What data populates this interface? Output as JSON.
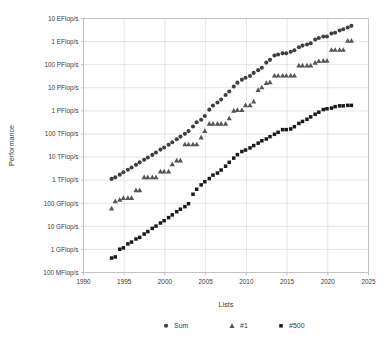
{
  "chart_data": {
    "type": "scatter",
    "title": "",
    "xlabel": "Lists",
    "ylabel": "Performance",
    "xlim": [
      1990,
      2025
    ],
    "ylim_flops": [
      100000000.0,
      1e+19
    ],
    "grid": true,
    "legend_position": "bottom",
    "x_ticks": [
      "1990",
      "1995",
      "2000",
      "2005",
      "2010",
      "2015",
      "2020",
      "2025"
    ],
    "x_tick_values": [
      1990,
      1995,
      2000,
      2005,
      2010,
      2015,
      2020,
      2025
    ],
    "y_ticks": [
      "100 MFlop/s",
      "1 GFlop/s",
      "10 GFlop/s",
      "100 GFlop/s",
      "1 TFlop/s",
      "10 TFlop/s",
      "100 TFlop/s",
      "1 PFlop/s",
      "10 PFlop/s",
      "100 PFlop/s",
      "1 EFlop/s",
      "10 EFlop/s"
    ],
    "y_tick_values": [
      100000000.0,
      1000000000.0,
      10000000000.0,
      100000000000.0,
      1000000000000.0,
      10000000000000.0,
      100000000000000.0,
      1000000000000000.0,
      1e+16,
      1e+17,
      1e+18,
      1e+19
    ],
    "series": [
      {
        "name": "Sum",
        "marker": "circle",
        "color": "#3f3f3f",
        "x": [
          1993.45,
          1993.9,
          1994.45,
          1994.9,
          1995.45,
          1995.9,
          1996.45,
          1996.9,
          1997.45,
          1997.9,
          1998.45,
          1998.9,
          1999.45,
          1999.9,
          2000.45,
          2000.9,
          2001.45,
          2001.9,
          2002.45,
          2002.9,
          2003.45,
          2003.9,
          2004.45,
          2004.9,
          2005.45,
          2005.9,
          2006.45,
          2006.9,
          2007.45,
          2007.9,
          2008.45,
          2008.9,
          2009.45,
          2009.9,
          2010.45,
          2010.9,
          2011.45,
          2011.9,
          2012.45,
          2012.9,
          2013.45,
          2013.9,
          2014.45,
          2014.9,
          2015.45,
          2015.9,
          2016.45,
          2016.9,
          2017.45,
          2017.9,
          2018.45,
          2018.9,
          2019.45,
          2019.9,
          2020.45,
          2020.9,
          2021.45,
          2021.9,
          2022.45,
          2022.9
        ],
        "y": [
          1130000000000.0,
          1320000000000.0,
          1730000000000.0,
          2200000000000.0,
          2800000000000.0,
          3500000000000.0,
          4600000000000.0,
          5900000000000.0,
          7600000000000.0,
          9600000000000.0,
          12400000000000.0,
          15800000000000.0,
          21000000000000.0,
          26000000000000.0,
          34000000000000.0,
          44000000000000.0,
          59000000000000.0,
          77000000000000.0,
          101000000000000.0,
          133000000000000.0,
          210000000000000.0,
          320000000000000.0,
          410000000000000.0,
          600000000000000.0,
          1130000000000000.0,
          1690000000000000.0,
          2300000000000000.0,
          3100000000000000.0,
          4900000000000000.0,
          6900000000000000.0,
          1.13e+16,
          1.67e+16,
          2.25e+16,
          2.73e+16,
          3.24e+16,
          4.4e+16,
          5.8e+16,
          7.4e+16,
          1.23e+17,
          1.62e+17,
          2.5e+17,
          2.74e+17,
          3.09e+17,
          3.09e+17,
          3.63e+17,
          4.2e+17,
          5.7e+17,
          6.7e+17,
          7.5e+17,
          8.5e+17,
          1.22e+18,
          1.42e+18,
          1.65e+18,
          1.65e+18,
          2.23e+18,
          2.43e+18,
          3e+18,
          3.4e+18,
          4.1e+18,
          4.8e+18
        ]
      },
      {
        "name": "#1",
        "marker": "triangle",
        "color": "#555555",
        "x": [
          1993.45,
          1993.9,
          1994.45,
          1994.9,
          1995.45,
          1995.9,
          1996.45,
          1996.9,
          1997.45,
          1997.9,
          1998.45,
          1998.9,
          1999.45,
          1999.9,
          2000.45,
          2000.9,
          2001.45,
          2001.9,
          2002.45,
          2002.9,
          2003.45,
          2003.9,
          2004.45,
          2004.9,
          2005.45,
          2005.9,
          2006.45,
          2006.9,
          2007.45,
          2007.9,
          2008.45,
          2008.9,
          2009.45,
          2009.9,
          2010.45,
          2010.9,
          2011.45,
          2011.9,
          2012.45,
          2012.9,
          2013.45,
          2013.9,
          2014.45,
          2014.9,
          2015.45,
          2015.9,
          2016.45,
          2016.9,
          2017.45,
          2017.9,
          2018.45,
          2018.9,
          2019.45,
          2019.9,
          2020.45,
          2020.9,
          2021.45,
          2021.9,
          2022.45,
          2022.9
        ],
        "y": [
          59400000000.0,
          124000000000.0,
          143000000000.0,
          170000000000.0,
          170000000000.0,
          170000000000.0,
          368000000000.0,
          368000000000.0,
          1340000000000.0,
          1340000000000.0,
          1340000000000.0,
          1340000000000.0,
          2380000000000.0,
          2380000000000.0,
          2380000000000.0,
          4940000000000.0,
          7230000000000.0,
          7230000000000.0,
          35900000000000.0,
          35900000000000.0,
          35900000000000.0,
          35900000000000.0,
          70700000000000.0,
          136000000000000.0,
          280000000000000.0,
          280000000000000.0,
          280000000000000.0,
          280000000000000.0,
          280000000000000.0,
          478000000000000.0,
          1030000000000000.0,
          1110000000000000.0,
          1110000000000000.0,
          1760000000000000.0,
          1760000000000000.0,
          2570000000000000.0,
          8160000000000000.0,
          1.05e+16,
          1.63e+16,
          1.75e+16,
          3.39e+16,
          3.39e+16,
          3.39e+16,
          3.39e+16,
          3.39e+16,
          3.39e+16,
          9.3e+16,
          9.3e+16,
          9.3e+16,
          9.3e+16,
          1.22e+17,
          1.44e+17,
          1.49e+17,
          1.49e+17,
          4.42e+17,
          4.42e+17,
          4.42e+17,
          4.42e+17,
          1.1e+18,
          1.1e+18
        ]
      },
      {
        "name": "#500",
        "marker": "square",
        "color": "#1a1a1a",
        "x": [
          1993.45,
          1993.9,
          1994.45,
          1994.9,
          1995.45,
          1995.9,
          1996.45,
          1996.9,
          1997.45,
          1997.9,
          1998.45,
          1998.9,
          1999.45,
          1999.9,
          2000.45,
          2000.9,
          2001.45,
          2001.9,
          2002.45,
          2002.9,
          2003.45,
          2003.9,
          2004.45,
          2004.9,
          2005.45,
          2005.9,
          2006.45,
          2006.9,
          2007.45,
          2007.9,
          2008.45,
          2008.9,
          2009.45,
          2009.9,
          2010.45,
          2010.9,
          2011.45,
          2011.9,
          2012.45,
          2012.9,
          2013.45,
          2013.9,
          2014.45,
          2014.9,
          2015.45,
          2015.9,
          2016.45,
          2016.9,
          2017.45,
          2017.9,
          2018.45,
          2018.9,
          2019.45,
          2019.9,
          2020.45,
          2020.9,
          2021.45,
          2021.9,
          2022.45,
          2022.9
        ],
        "y": [
          422000000.0,
          472000000.0,
          1020000000.0,
          1170000000.0,
          1730000000.0,
          2080000000.0,
          2830000000.0,
          3310000000.0,
          4620000000.0,
          5920000000.0,
          8150000000.0,
          10200000000.0,
          13900000000.0,
          17500000000.0,
          23800000000.0,
          31200000000.0,
          42900000000.0,
          55100000000.0,
          71200000000.0,
          95500000000.0,
          245000000000.0,
          403000000000.0,
          624000000000.0,
          851000000000.0,
          1170000000000.0,
          1650000000000.0,
          2030000000000.0,
          2740000000000.0,
          4000000000000.0,
          5900000000000.0,
          8990000000000.0,
          12700000000000.0,
          17300000000000.0,
          20100000000000.0,
          24800000000000.0,
          31300000000000.0,
          40000000000000.0,
          50700000000000.0,
          60300000000000.0,
          76500000000000.0,
          96500000000000.0,
          118000000000000.0,
          154000000000000.0,
          154000000000000.0,
          165000000000000.0,
          206000000000000.0,
          286000000000000.0,
          349000000000000.0,
          432000000000000.0,
          548000000000000.0,
          716000000000000.0,
          874000000000000.0,
          1140000000000000.0,
          1230000000000000.0,
          1320000000000000.0,
          1520000000000000.0,
          1650000000000000.0,
          1650000000000000.0,
          1730000000000000.0,
          1730000000000000.0
        ]
      }
    ],
    "legend": [
      {
        "label": "Sum",
        "marker": "circle",
        "color": "#3f3f3f"
      },
      {
        "label": "#1",
        "marker": "triangle",
        "color": "#555555"
      },
      {
        "label": "#500",
        "marker": "square",
        "color": "#1a1a1a"
      }
    ]
  }
}
